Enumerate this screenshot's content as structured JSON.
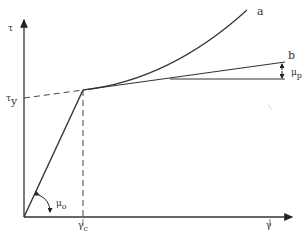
{
  "diagram": {
    "type": "stress-strain bilinear curve",
    "axes": {
      "y_label": "τ",
      "x_label": "γ"
    },
    "labels": {
      "tau_y": "τ",
      "tau_y_sub": "y",
      "gamma_c": "γ",
      "gamma_c_sub": "c",
      "mu_o": "μ",
      "mu_o_sub": "o",
      "mu_p": "μ",
      "mu_p_sub": "p",
      "curve_a": "a",
      "curve_b": "b"
    },
    "colors": {
      "line": "#333333",
      "background": "#ffffff"
    }
  }
}
